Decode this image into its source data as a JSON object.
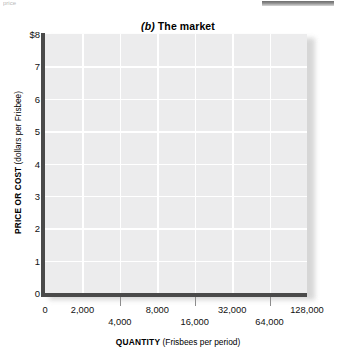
{
  "artifacts": {
    "top_left_fragment": "price",
    "top_right_bar": "rule-fragment"
  },
  "chart_data": {
    "type": "line",
    "panel_letter": "(b)",
    "panel_name": "The market",
    "xlabel_bold": "QUANTITY",
    "xlabel_rest": "(Frisbees per period)",
    "ylabel_bold": "PRICE OR COST",
    "ylabel_rest": "(dollars per Frisbee)",
    "grid": true,
    "legend": "none",
    "series": [],
    "x_scale": "log2-style staggered",
    "ylim": [
      0,
      8
    ],
    "xlim_labels": [
      "0",
      "2,000",
      "4,000",
      "8,000",
      "16,000",
      "32,000",
      "64,000",
      "128,000"
    ],
    "yticks": [
      {
        "value": 8,
        "label": "$8"
      },
      {
        "value": 7,
        "label": "7"
      },
      {
        "value": 6,
        "label": "6"
      },
      {
        "value": 5,
        "label": "5"
      },
      {
        "value": 4,
        "label": "4"
      },
      {
        "value": 3,
        "label": "3"
      },
      {
        "value": 2,
        "label": "2"
      },
      {
        "value": 1,
        "label": "1"
      },
      {
        "value": 0,
        "label": "0"
      }
    ],
    "xticks": [
      {
        "label": "0",
        "pos_pct": 0,
        "row": "top"
      },
      {
        "label": "2,000",
        "pos_pct": 14.29,
        "row": "top"
      },
      {
        "label": "4,000",
        "pos_pct": 28.57,
        "row": "bottom"
      },
      {
        "label": "8,000",
        "pos_pct": 42.86,
        "row": "top"
      },
      {
        "label": "16,000",
        "pos_pct": 57.14,
        "row": "bottom"
      },
      {
        "label": "32,000",
        "pos_pct": 71.43,
        "row": "top"
      },
      {
        "label": "64,000",
        "pos_pct": 85.71,
        "row": "bottom"
      },
      {
        "label": "128,000",
        "pos_pct": 100,
        "row": "top"
      }
    ],
    "colors": {
      "plot_background": "#ececed",
      "gridline": "#ffffff",
      "axis_line": "#4a4a4a",
      "tick_mark": "#8d8d8d",
      "text": "#111111"
    }
  }
}
